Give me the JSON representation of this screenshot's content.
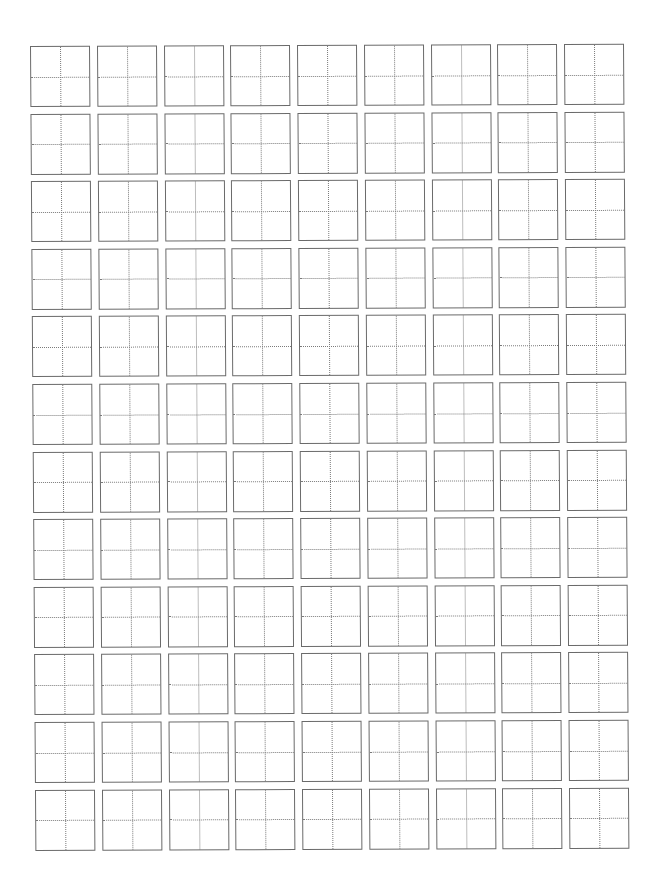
{
  "page": {
    "type": "character practice grid (田字格)",
    "rows": 12,
    "columns": 9,
    "cells_filled": 0,
    "colors": {
      "background": "#ffffff",
      "cell_border": "#6a6a6a",
      "guide_line": "#7a7a7a"
    }
  }
}
